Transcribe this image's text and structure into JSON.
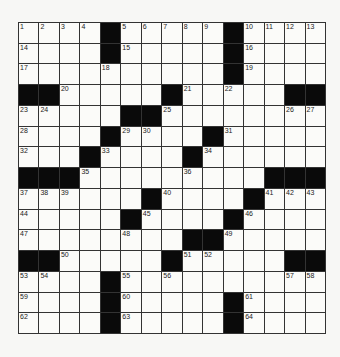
{
  "puzzle": {
    "rows": 15,
    "cols": 15,
    "colors": {
      "black": "#0a0a0a",
      "white": "#fbfbf9",
      "line": "#333333"
    },
    "layout": [
      "....#.....#....",
      "....#.....#....",
      "..........#....",
      "##.....#.....##",
      ".....##.....",
      "....#....#.....",
      "...#....#......",
      "###.........###",
      "......#....#...",
      ".....#....#....",
      "........##.....",
      "##.....#.....##",
      "....#..........",
      "....#.....#....",
      "....#.....#...."
    ],
    "numbers": [
      {
        "r": 0,
        "c": 0,
        "n": "1"
      },
      {
        "r": 0,
        "c": 1,
        "n": "2"
      },
      {
        "r": 0,
        "c": 2,
        "n": "3"
      },
      {
        "r": 0,
        "c": 3,
        "n": "4"
      },
      {
        "r": 0,
        "c": 5,
        "n": "5"
      },
      {
        "r": 0,
        "c": 6,
        "n": "6"
      },
      {
        "r": 0,
        "c": 7,
        "n": "7"
      },
      {
        "r": 0,
        "c": 8,
        "n": "8"
      },
      {
        "r": 0,
        "c": 9,
        "n": "9"
      },
      {
        "r": 0,
        "c": 11,
        "n": "10"
      },
      {
        "r": 0,
        "c": 12,
        "n": "11"
      },
      {
        "r": 0,
        "c": 13,
        "n": "12"
      },
      {
        "r": 0,
        "c": 14,
        "n": "13"
      },
      {
        "r": 1,
        "c": 0,
        "n": "14"
      },
      {
        "r": 1,
        "c": 5,
        "n": "15"
      },
      {
        "r": 1,
        "c": 11,
        "n": "16"
      },
      {
        "r": 2,
        "c": 0,
        "n": "17"
      },
      {
        "r": 2,
        "c": 4,
        "n": "18"
      },
      {
        "r": 2,
        "c": 11,
        "n": "19"
      },
      {
        "r": 3,
        "c": 2,
        "n": "20"
      },
      {
        "r": 3,
        "c": 8,
        "n": "21"
      },
      {
        "r": 3,
        "c": 10,
        "n": "22"
      },
      {
        "r": 4,
        "c": 0,
        "n": "23"
      },
      {
        "r": 4,
        "c": 1,
        "n": "24"
      },
      {
        "r": 4,
        "c": 7,
        "n": "25"
      },
      {
        "r": 4,
        "c": 13,
        "n": "26"
      },
      {
        "r": 4,
        "c": 14,
        "n": "27"
      },
      {
        "r": 5,
        "c": 0,
        "n": "28"
      },
      {
        "r": 5,
        "c": 5,
        "n": "29"
      },
      {
        "r": 5,
        "c": 6,
        "n": "30"
      },
      {
        "r": 5,
        "c": 10,
        "n": "31"
      },
      {
        "r": 6,
        "c": 0,
        "n": "32"
      },
      {
        "r": 6,
        "c": 4,
        "n": "33"
      },
      {
        "r": 6,
        "c": 9,
        "n": "34"
      },
      {
        "r": 7,
        "c": 3,
        "n": "35"
      },
      {
        "r": 7,
        "c": 8,
        "n": "36"
      },
      {
        "r": 8,
        "c": 0,
        "n": "37"
      },
      {
        "r": 8,
        "c": 1,
        "n": "38"
      },
      {
        "r": 8,
        "c": 2,
        "n": "39"
      },
      {
        "r": 8,
        "c": 7,
        "n": "40"
      },
      {
        "r": 8,
        "c": 12,
        "n": "41"
      },
      {
        "r": 8,
        "c": 13,
        "n": "42"
      },
      {
        "r": 8,
        "c": 14,
        "n": "43"
      },
      {
        "r": 9,
        "c": 0,
        "n": "44"
      },
      {
        "r": 9,
        "c": 6,
        "n": "45"
      },
      {
        "r": 9,
        "c": 11,
        "n": "46"
      },
      {
        "r": 10,
        "c": 0,
        "n": "47"
      },
      {
        "r": 10,
        "c": 5,
        "n": "48"
      },
      {
        "r": 10,
        "c": 10,
        "n": "49"
      },
      {
        "r": 11,
        "c": 2,
        "n": "50"
      },
      {
        "r": 11,
        "c": 8,
        "n": "51"
      },
      {
        "r": 11,
        "c": 9,
        "n": "52"
      },
      {
        "r": 12,
        "c": 0,
        "n": "53"
      },
      {
        "r": 12,
        "c": 1,
        "n": "54"
      },
      {
        "r": 12,
        "c": 5,
        "n": "55"
      },
      {
        "r": 12,
        "c": 7,
        "n": "56"
      },
      {
        "r": 12,
        "c": 13,
        "n": "57"
      },
      {
        "r": 12,
        "c": 14,
        "n": "58"
      },
      {
        "r": 13,
        "c": 0,
        "n": "59"
      },
      {
        "r": 13,
        "c": 5,
        "n": "60"
      },
      {
        "r": 13,
        "c": 11,
        "n": "61"
      },
      {
        "r": 14,
        "c": 0,
        "n": "62"
      },
      {
        "r": 14,
        "c": 5,
        "n": "63"
      },
      {
        "r": 14,
        "c": 11,
        "n": "64"
      }
    ]
  }
}
